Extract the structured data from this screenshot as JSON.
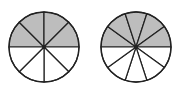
{
  "colors": {
    "shaded": "#bdbdbd",
    "unshaded": "#ffffff",
    "stroke": "#222222"
  },
  "circles": [
    {
      "name": "left-circle",
      "sectors": 8,
      "shaded": 4,
      "shaded_region": "top-half",
      "fraction": "4/8"
    },
    {
      "name": "right-circle",
      "sectors": 10,
      "shaded": 5,
      "shaded_region": "top-half",
      "fraction": "5/10"
    }
  ]
}
